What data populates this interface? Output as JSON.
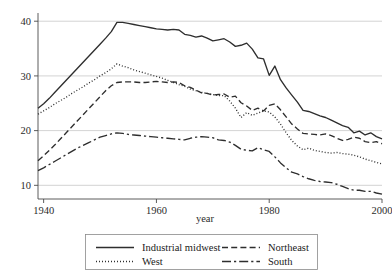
{
  "chart_data": {
    "type": "line",
    "title": "",
    "xlabel": "year",
    "ylabel": "",
    "xlim": [
      1939,
      2000
    ],
    "ylim": [
      7.5,
      41.5
    ],
    "grid": "horizontal",
    "legend_position": "bottom",
    "x_ticks": [
      1940,
      1960,
      1980,
      2000
    ],
    "y_ticks": [
      10,
      20,
      30,
      40
    ],
    "x": [
      1939,
      1940,
      1941,
      1942,
      1943,
      1944,
      1945,
      1946,
      1947,
      1948,
      1949,
      1950,
      1951,
      1952,
      1953,
      1954,
      1955,
      1956,
      1957,
      1958,
      1959,
      1960,
      1961,
      1962,
      1963,
      1964,
      1965,
      1966,
      1967,
      1968,
      1969,
      1970,
      1971,
      1972,
      1973,
      1974,
      1975,
      1976,
      1977,
      1978,
      1979,
      1980,
      1981,
      1982,
      1983,
      1984,
      1985,
      1986,
      1987,
      1988,
      1989,
      1990,
      1991,
      1992,
      1993,
      1994,
      1995,
      1996,
      1997,
      1998,
      1999,
      2000
    ],
    "series": [
      {
        "name": "Industrial midwest",
        "style": "solid",
        "values": [
          24.1,
          24.9,
          25.9,
          27.0,
          28.1,
          29.2,
          30.3,
          31.4,
          32.5,
          33.6,
          34.7,
          35.8,
          36.9,
          38.1,
          39.8,
          39.8,
          39.6,
          39.4,
          39.2,
          39.0,
          38.8,
          38.6,
          38.5,
          38.4,
          38.5,
          38.4,
          37.6,
          37.4,
          37.1,
          37.3,
          36.9,
          36.4,
          36.6,
          36.8,
          36.2,
          35.4,
          35.6,
          36.0,
          34.9,
          33.3,
          33.1,
          30.1,
          31.8,
          29.3,
          27.8,
          26.5,
          25.2,
          23.7,
          23.5,
          23.1,
          22.7,
          22.4,
          21.9,
          21.4,
          20.9,
          20.6,
          19.6,
          19.9,
          19.2,
          19.6,
          18.9,
          18.5
        ]
      },
      {
        "name": "West",
        "style": "dotted",
        "values": [
          23.0,
          23.6,
          24.2,
          24.9,
          25.5,
          26.1,
          26.8,
          27.4,
          28.0,
          28.7,
          29.3,
          30.0,
          30.6,
          31.3,
          32.2,
          31.8,
          31.5,
          31.1,
          30.8,
          30.5,
          30.2,
          29.9,
          29.6,
          29.2,
          28.8,
          28.4,
          28.1,
          27.6,
          27.3,
          27.0,
          26.8,
          26.6,
          26.4,
          26.4,
          25.4,
          24.1,
          22.4,
          23.3,
          22.8,
          23.2,
          23.6,
          23.4,
          22.5,
          21.2,
          19.6,
          18.2,
          17.2,
          16.5,
          16.8,
          16.4,
          16.2,
          16.0,
          15.9,
          16.0,
          15.8,
          15.7,
          15.5,
          15.2,
          14.8,
          14.5,
          14.2,
          13.9
        ]
      },
      {
        "name": "Northeast",
        "style": "dashed",
        "values": [
          14.5,
          15.4,
          16.4,
          17.4,
          18.5,
          19.6,
          20.7,
          21.8,
          22.9,
          24.0,
          25.1,
          26.2,
          27.3,
          28.2,
          28.8,
          28.9,
          28.9,
          28.9,
          28.8,
          28.8,
          28.9,
          29.0,
          28.9,
          28.8,
          28.9,
          28.8,
          28.2,
          27.9,
          27.4,
          26.9,
          26.8,
          26.5,
          26.6,
          26.7,
          26.1,
          26.3,
          25.1,
          24.5,
          23.7,
          24.1,
          23.6,
          24.6,
          24.9,
          23.8,
          22.5,
          21.2,
          20.3,
          19.5,
          19.4,
          19.3,
          19.2,
          19.4,
          19.1,
          18.6,
          18.2,
          18.4,
          18.8,
          18.6,
          18.0,
          17.8,
          18.0,
          17.6
        ]
      },
      {
        "name": "South",
        "style": "dashdot",
        "values": [
          12.7,
          13.2,
          13.8,
          14.4,
          15.0,
          15.6,
          16.2,
          16.8,
          17.3,
          17.8,
          18.3,
          18.8,
          19.1,
          19.4,
          19.6,
          19.5,
          19.3,
          19.2,
          19.1,
          19.0,
          18.9,
          18.8,
          18.7,
          18.6,
          18.5,
          18.4,
          18.3,
          18.6,
          18.8,
          18.9,
          18.8,
          18.7,
          18.3,
          18.2,
          17.9,
          17.3,
          16.6,
          16.4,
          16.3,
          16.9,
          16.5,
          16.2,
          15.2,
          14.1,
          13.2,
          12.4,
          12.1,
          11.6,
          11.2,
          10.9,
          10.7,
          10.6,
          10.5,
          10.2,
          9.8,
          9.4,
          9.1,
          9.1,
          8.9,
          8.9,
          8.6,
          8.4
        ]
      }
    ]
  },
  "axis": {
    "x_tick_labels": [
      "1940",
      "1960",
      "1980",
      "2000"
    ],
    "y_tick_labels": [
      "10",
      "20",
      "30",
      "40"
    ],
    "x_axis_title": "year"
  },
  "legend": {
    "entries": [
      {
        "label": "Industrial midwest",
        "style": "solid"
      },
      {
        "label": "Northeast",
        "style": "dashed"
      },
      {
        "label": "West",
        "style": "dotted"
      },
      {
        "label": "South",
        "style": "dashdot"
      }
    ]
  }
}
